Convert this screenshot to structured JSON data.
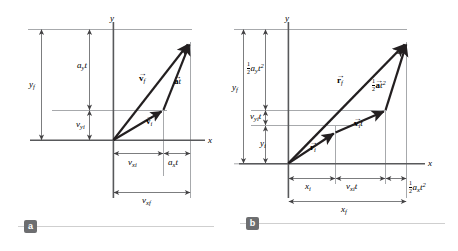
{
  "figure": {
    "panels": [
      {
        "id": "a",
        "badge": "a",
        "axes": {
          "x": "x",
          "y": "y"
        },
        "vectors": [
          {
            "name": "v-f",
            "label_base": "v",
            "label_sub": "f",
            "accent": "arrow",
            "bold": true
          },
          {
            "name": "v-i",
            "label_base": "v",
            "label_sub": "i",
            "accent": "arrow",
            "bold": true
          },
          {
            "name": "a-t",
            "label_base": "a",
            "label_suffix": "t",
            "accent": "arrow",
            "bold": true
          }
        ],
        "dimensions": {
          "y_total": {
            "base": "y",
            "sub": "f"
          },
          "y_upper": {
            "base": "a",
            "sub": "y",
            "suffix": "t"
          },
          "y_lower": {
            "base": "v",
            "sub": "yi"
          },
          "x_left": {
            "base": "v",
            "sub": "xi"
          },
          "x_right": {
            "base": "a",
            "sub": "x",
            "suffix": "t"
          },
          "x_total": {
            "base": "v",
            "sub": "xf"
          }
        }
      },
      {
        "id": "b",
        "badge": "b",
        "axes": {
          "x": "x",
          "y": "y"
        },
        "vectors": [
          {
            "name": "r-f",
            "label_base": "r",
            "label_sub": "f",
            "accent": "arrow",
            "bold": true
          },
          {
            "name": "r-i",
            "label_base": "r",
            "label_sub": "i",
            "accent": "arrow",
            "bold": true
          },
          {
            "name": "v-i-t",
            "label_base": "v",
            "label_sub": "i",
            "label_suffix": "t",
            "accent": "arrow",
            "bold": true
          },
          {
            "name": "half-a-t-squared",
            "fraction": "1/2",
            "label_base": "a",
            "label_suffix": "t",
            "exponent": "2",
            "accent": "arrow",
            "bold": true
          }
        ],
        "dimensions": {
          "y_total": {
            "base": "y",
            "sub": "f"
          },
          "y_upper": {
            "fraction": "1/2",
            "base": "a",
            "sub": "y",
            "suffix": "t",
            "exponent": "2"
          },
          "y_middle": {
            "base": "v",
            "sub": "yi",
            "suffix": "t"
          },
          "y_lower": {
            "base": "y",
            "sub": "i"
          },
          "x_left": {
            "base": "x",
            "sub": "i"
          },
          "x_middle": {
            "base": "v",
            "sub": "xi",
            "suffix": "t"
          },
          "x_right": {
            "fraction": "1/2",
            "base": "a",
            "sub": "x",
            "suffix": "t",
            "exponent": "2"
          },
          "x_total": {
            "base": "x",
            "sub": "f"
          }
        }
      }
    ],
    "colors": {
      "vector": "#231f20",
      "axis": "#58595b",
      "guide": "#a7a9ac",
      "dimension": "#6d6e70",
      "badge_bg": "#6d6e70",
      "badge_text": "#ffffff",
      "rule": "#cfcfcf",
      "background": "#ffffff"
    }
  }
}
